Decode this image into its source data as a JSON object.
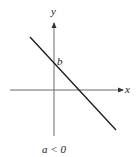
{
  "diagram": {
    "type": "linear-function-graph",
    "axes": {
      "x_label": "x",
      "y_label": "y"
    },
    "line": {
      "intercept_label": "b",
      "slope": "negative"
    },
    "caption": "a < 0",
    "colors": {
      "axis": "#6a6a6a",
      "line": "#1a1a1a",
      "text": "#222222"
    }
  }
}
